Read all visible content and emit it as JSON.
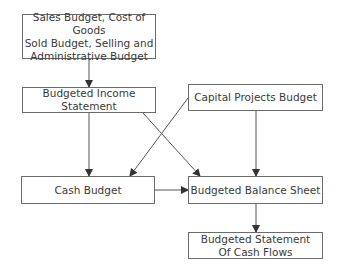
{
  "diagram": {
    "nodes": [
      {
        "id": "sales",
        "label": "Sales Budget, Cost of  Goods\nSold Budget, Selling and\nAdministrative Budget"
      },
      {
        "id": "income",
        "label": "Budgeted Income\nStatement"
      },
      {
        "id": "capital",
        "label": "Capital Projects Budget"
      },
      {
        "id": "cash",
        "label": "Cash Budget"
      },
      {
        "id": "balance",
        "label": "Budgeted Balance Sheet"
      },
      {
        "id": "cashflows",
        "label": "Budgeted Statement\nOf Cash Flows"
      }
    ],
    "edges": [
      {
        "from": "sales",
        "to": "income"
      },
      {
        "from": "income",
        "to": "cash"
      },
      {
        "from": "income",
        "to": "balance"
      },
      {
        "from": "capital",
        "to": "cash"
      },
      {
        "from": "capital",
        "to": "balance"
      },
      {
        "from": "cash",
        "to": "balance"
      },
      {
        "from": "balance",
        "to": "cashflows"
      }
    ],
    "colors": {
      "stroke": "#6b6b6b",
      "text": "#3a3a3a",
      "background": "#ffffff"
    }
  }
}
